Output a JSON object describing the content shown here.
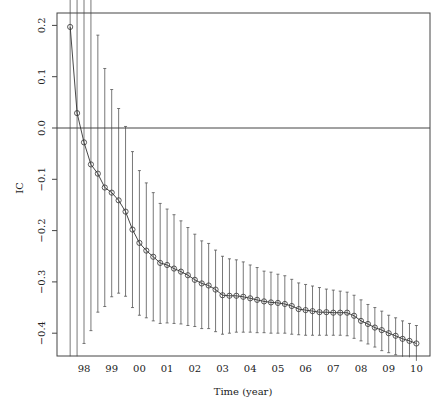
{
  "chart_data": {
    "type": "line",
    "title": "",
    "xlabel": "Time (year)",
    "ylabel": "IC",
    "xlim": [
      1997.0,
      2010.5
    ],
    "ylim": [
      -0.444,
      0.224
    ],
    "grid": false,
    "legend": null,
    "reference_line": {
      "y": 0.0
    },
    "x_tick_labels": [
      "98",
      "99",
      "00",
      "01",
      "02",
      "03",
      "04",
      "05",
      "06",
      "07",
      "08",
      "09",
      "10"
    ],
    "x_tick_values": [
      1998,
      1999,
      2000,
      2001,
      2002,
      2003,
      2004,
      2005,
      2006,
      2007,
      2008,
      2009,
      2010
    ],
    "y_tick_labels": [
      "-0.4",
      "-0.3",
      "-0.2",
      "-0.1",
      "0.0",
      "0.1",
      "0.2"
    ],
    "y_tick_values": [
      -0.4,
      -0.3,
      -0.2,
      -0.1,
      0.0,
      0.1,
      0.2
    ],
    "series": [
      {
        "name": "IC",
        "marker": "circle",
        "error_bars": true,
        "x": [
          1997.5,
          1997.75,
          1998.0,
          1998.25,
          1998.5,
          1998.75,
          1999.0,
          1999.25,
          1999.5,
          1999.75,
          2000.0,
          2000.25,
          2000.5,
          2000.75,
          2001.0,
          2001.25,
          2001.5,
          2001.75,
          2002.0,
          2002.25,
          2002.5,
          2002.75,
          2003.0,
          2003.25,
          2003.5,
          2003.75,
          2004.0,
          2004.25,
          2004.5,
          2004.75,
          2005.0,
          2005.25,
          2005.5,
          2005.75,
          2006.0,
          2006.25,
          2006.5,
          2006.75,
          2007.0,
          2007.25,
          2007.5,
          2007.75,
          2008.0,
          2008.25,
          2008.5,
          2008.75,
          2009.0,
          2009.25,
          2009.5,
          2009.75,
          2010.0
        ],
        "values": [
          0.197,
          0.029,
          -0.028,
          -0.071,
          -0.089,
          -0.116,
          -0.126,
          -0.141,
          -0.163,
          -0.198,
          -0.224,
          -0.239,
          -0.251,
          -0.263,
          -0.267,
          -0.274,
          -0.28,
          -0.287,
          -0.296,
          -0.303,
          -0.307,
          -0.315,
          -0.326,
          -0.327,
          -0.327,
          -0.329,
          -0.332,
          -0.335,
          -0.338,
          -0.34,
          -0.341,
          -0.343,
          -0.347,
          -0.353,
          -0.355,
          -0.357,
          -0.359,
          -0.359,
          -0.36,
          -0.36,
          -0.36,
          -0.366,
          -0.376,
          -0.382,
          -0.389,
          -0.394,
          -0.4,
          -0.405,
          -0.411,
          -0.415,
          -0.42
        ],
        "upper": [
          0.25,
          0.25,
          0.25,
          0.25,
          0.181,
          0.116,
          0.075,
          0.038,
          0.003,
          -0.046,
          -0.083,
          -0.107,
          -0.126,
          -0.147,
          -0.158,
          -0.169,
          -0.181,
          -0.194,
          -0.207,
          -0.22,
          -0.225,
          -0.238,
          -0.25,
          -0.255,
          -0.257,
          -0.261,
          -0.267,
          -0.272,
          -0.279,
          -0.281,
          -0.285,
          -0.288,
          -0.295,
          -0.302,
          -0.305,
          -0.308,
          -0.311,
          -0.314,
          -0.316,
          -0.318,
          -0.32,
          -0.326,
          -0.335,
          -0.344,
          -0.35,
          -0.357,
          -0.365,
          -0.37,
          -0.376,
          -0.381,
          -0.385
        ],
        "lower": [
          -0.445,
          -0.445,
          -0.42,
          -0.395,
          -0.359,
          -0.348,
          -0.329,
          -0.322,
          -0.328,
          -0.35,
          -0.365,
          -0.37,
          -0.376,
          -0.381,
          -0.38,
          -0.381,
          -0.382,
          -0.385,
          -0.387,
          -0.391,
          -0.391,
          -0.397,
          -0.402,
          -0.4,
          -0.398,
          -0.398,
          -0.398,
          -0.399,
          -0.399,
          -0.4,
          -0.4,
          -0.4,
          -0.402,
          -0.403,
          -0.404,
          -0.404,
          -0.404,
          -0.404,
          -0.404,
          -0.404,
          -0.405,
          -0.41,
          -0.415,
          -0.421,
          -0.427,
          -0.434,
          -0.438,
          -0.442,
          -0.446,
          -0.447,
          -0.454
        ]
      }
    ]
  },
  "colors": {
    "line": "#333333",
    "frame": "#444444",
    "errorbar": "#555555",
    "background": "#ffffff"
  }
}
